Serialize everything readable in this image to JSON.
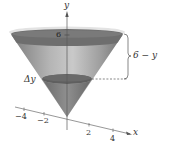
{
  "figure": {
    "type": "cone-volume-slice",
    "axes": {
      "y_label": "y",
      "x_label": "x",
      "x_ticks": [
        "−4",
        "−2",
        "2",
        "4"
      ],
      "y_tick_label": "6"
    },
    "annotations": {
      "slice_label": "Δy",
      "brace_label": "6 − y"
    },
    "colors": {
      "cone_outer": "#8c8c8c",
      "cone_inner_light": "#c8c8c8",
      "top_surface": "#6e6e6e",
      "rim": "#e3e3e3",
      "slice": "#5f5f5f",
      "axis": "#555555",
      "text": "#333333"
    }
  }
}
